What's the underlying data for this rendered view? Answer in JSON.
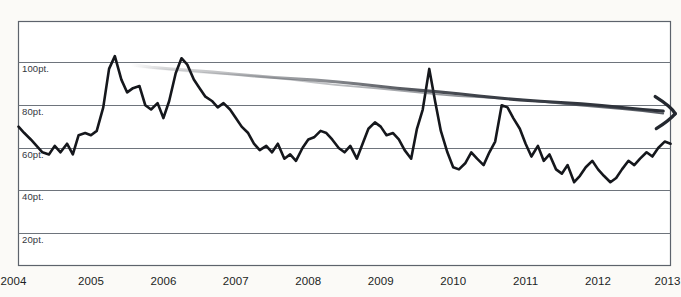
{
  "chart_data": {
    "type": "line",
    "title": "",
    "subtitle": "",
    "xlabel": "",
    "ylabel": "",
    "xlim": [
      2004,
      2013
    ],
    "ylim": [
      10,
      110
    ],
    "grid": true,
    "legend_position": "none",
    "y_ticks": [
      20,
      40,
      60,
      80,
      100
    ],
    "y_tick_labels": [
      "20pt.",
      "40pt.",
      "60pt.",
      "80pt.",
      "100pt."
    ],
    "x_ticks": [
      2004,
      2005,
      2006,
      2007,
      2008,
      2009,
      2010,
      2011,
      2012,
      2013
    ],
    "x_tick_labels": [
      "2004",
      "2005",
      "2006",
      "2007",
      "2008",
      "2009",
      "2010",
      "2011",
      "2012",
      "2013"
    ],
    "series": [
      {
        "name": "score",
        "color": "#15171c",
        "x": [
          2004.0,
          2004.08,
          2004.17,
          2004.25,
          2004.33,
          2004.42,
          2004.5,
          2004.58,
          2004.67,
          2004.75,
          2004.83,
          2004.92,
          2005.0,
          2005.08,
          2005.17,
          2005.25,
          2005.33,
          2005.42,
          2005.5,
          2005.58,
          2005.67,
          2005.75,
          2005.83,
          2005.92,
          2006.0,
          2006.08,
          2006.17,
          2006.25,
          2006.33,
          2006.42,
          2006.5,
          2006.58,
          2006.67,
          2006.75,
          2006.83,
          2006.92,
          2007.0,
          2007.08,
          2007.17,
          2007.25,
          2007.33,
          2007.42,
          2007.5,
          2007.58,
          2007.67,
          2007.75,
          2007.83,
          2007.92,
          2008.0,
          2008.08,
          2008.17,
          2008.25,
          2008.33,
          2008.42,
          2008.5,
          2008.58,
          2008.67,
          2008.75,
          2008.83,
          2008.92,
          2009.0,
          2009.08,
          2009.17,
          2009.25,
          2009.33,
          2009.42,
          2009.5,
          2009.58,
          2009.67,
          2009.75,
          2009.83,
          2009.92,
          2010.0,
          2010.08,
          2010.17,
          2010.25,
          2010.33,
          2010.42,
          2010.5,
          2010.58,
          2010.67,
          2010.75,
          2010.83,
          2010.92,
          2011.0,
          2011.08,
          2011.17,
          2011.25,
          2011.33,
          2011.42,
          2011.5,
          2011.58,
          2011.67,
          2011.75,
          2011.83,
          2011.92,
          2012.0,
          2012.08,
          2012.17,
          2012.25,
          2012.33,
          2012.42,
          2012.5,
          2012.58,
          2012.67,
          2012.75,
          2012.83,
          2012.92,
          2013.0
        ],
        "y": [
          70,
          67,
          64,
          61,
          58,
          57,
          61,
          58,
          62,
          57,
          66,
          67,
          66,
          68,
          79,
          97,
          103,
          92,
          86,
          88,
          89,
          80,
          78,
          81,
          74,
          82,
          95,
          102,
          99,
          92,
          88,
          84,
          82,
          79,
          81,
          78,
          74,
          70,
          67,
          62,
          59,
          61,
          58,
          62,
          55,
          57,
          54,
          60,
          64,
          65,
          68,
          67,
          64,
          60,
          58,
          61,
          55,
          62,
          69,
          72,
          70,
          66,
          67,
          64,
          59,
          55,
          69,
          78,
          97,
          82,
          68,
          58,
          51,
          50,
          53,
          58,
          55,
          52,
          58,
          63,
          80,
          79,
          74,
          69,
          62,
          56,
          61,
          54,
          57,
          50,
          48,
          52,
          44,
          47,
          51,
          54,
          50,
          47,
          44,
          46,
          50,
          54,
          52,
          55,
          58,
          56,
          60,
          63,
          62
        ]
      }
    ],
    "annotations": [
      {
        "type": "trend-arrow",
        "style": "hand-drawn",
        "color": "#2c3038",
        "from": {
          "x": 2005.55,
          "y": 99
        },
        "to": {
          "x": 2012.9,
          "y": 77
        },
        "description": "hand-drawn declining trend arrow fading in from left, solid toward right, arrowhead at right"
      }
    ]
  }
}
